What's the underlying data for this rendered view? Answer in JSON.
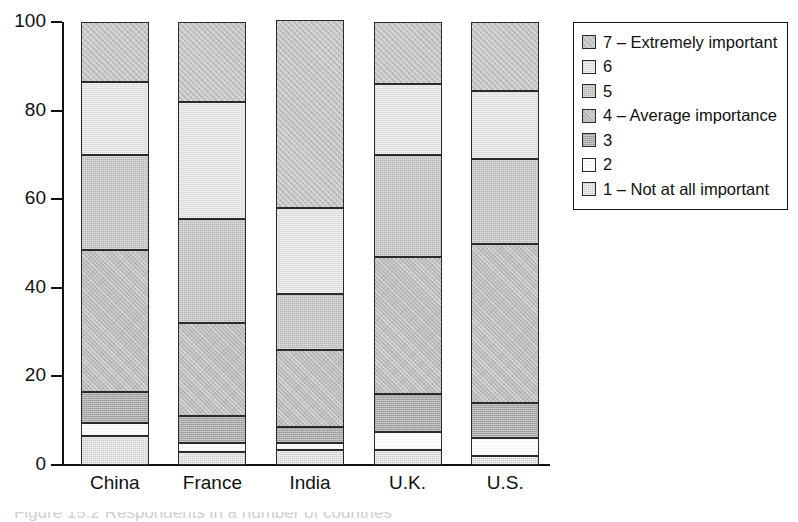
{
  "chart_data": {
    "type": "bar",
    "title": "",
    "subtitle": "",
    "xlabel": "",
    "ylabel": "",
    "ylim": [
      0,
      100
    ],
    "yticks": [
      0,
      20,
      40,
      60,
      80,
      100
    ],
    "grid": false,
    "stacked": true,
    "legend_position": "right",
    "categories": [
      "China",
      "France",
      "India",
      "U.K.",
      "U.S."
    ],
    "series": [
      {
        "name": "1 – Not at all important",
        "key": "1",
        "fill": "f1",
        "values": [
          6.5,
          3.0,
          3.5,
          3.5,
          2.0
        ]
      },
      {
        "name": "2",
        "key": "2",
        "fill": "f2",
        "values": [
          3.0,
          2.0,
          1.5,
          4.0,
          4.0
        ]
      },
      {
        "name": "3",
        "key": "3",
        "fill": "f3",
        "values": [
          7.0,
          6.0,
          3.5,
          8.5,
          8.0
        ]
      },
      {
        "name": "4 – Average importance",
        "key": "4",
        "fill": "f4",
        "values": [
          32.0,
          21.0,
          17.5,
          31.0,
          36.0
        ]
      },
      {
        "name": "5",
        "key": "5",
        "fill": "f5",
        "values": [
          21.5,
          23.5,
          12.5,
          23.0,
          19.0
        ]
      },
      {
        "name": "6",
        "key": "6",
        "fill": "f6",
        "values": [
          16.5,
          26.5,
          19.5,
          16.0,
          15.5
        ]
      },
      {
        "name": "7 – Extremely important",
        "key": "7",
        "fill": "f7",
        "values": [
          13.5,
          18.0,
          42.5,
          14.0,
          15.5
        ]
      }
    ],
    "legend_entries": [
      {
        "label": "7 – Extremely important",
        "fill": "f7"
      },
      {
        "label": "6",
        "fill": "f6"
      },
      {
        "label": "5",
        "fill": "f5"
      },
      {
        "label": "4 – Average importance",
        "fill": "f4"
      },
      {
        "label": "3",
        "fill": "f3"
      },
      {
        "label": "2",
        "fill": "f2"
      },
      {
        "label": "1 – Not at all important",
        "fill": "f1"
      }
    ],
    "axis_color": "#111111",
    "background": "#ffffff"
  },
  "caption": {
    "partial_text": "Figure 15.2   Respondents in a number of countries"
  }
}
